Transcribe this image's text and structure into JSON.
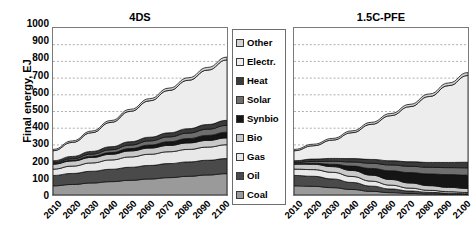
{
  "chart_data": {
    "type": "area",
    "title": "",
    "ylabel": "Final energy, EJ",
    "xlabel": "",
    "ylim": [
      0,
      1000
    ],
    "ytick_step": 100,
    "yticks": [
      1000,
      900,
      800,
      700,
      600,
      500,
      400,
      300,
      200,
      100,
      0
    ],
    "grid": true,
    "grid_style": "dotted-horizontal",
    "legend_position": "center-between-panels",
    "stack_order_bottom_to_top": [
      "Coal",
      "Oil",
      "Gas",
      "Bio",
      "Synbio",
      "Solar",
      "Heat",
      "Electr.",
      "Other"
    ],
    "series_colors": {
      "Other": "#d4d4d4",
      "Electr.": "#ededed",
      "Heat": "#3a3a3a",
      "Solar": "#6e6e6e",
      "Synbio": "#151515",
      "Bio": "#c9c9c9",
      "Gas": "#e8e8e8",
      "Oil": "#4a4a4a",
      "Coal": "#9a9a9a"
    },
    "x": [
      2010,
      2020,
      2030,
      2040,
      2050,
      2060,
      2070,
      2080,
      2090,
      2100
    ],
    "panels": [
      {
        "name": "4DS",
        "title": "4DS",
        "series": [
          {
            "name": "Coal",
            "values": [
              55,
              63,
              72,
              80,
              88,
              96,
              104,
              112,
              120,
              128
            ]
          },
          {
            "name": "Oil",
            "values": [
              62,
              66,
              70,
              74,
              78,
              81,
              84,
              86,
              88,
              90
            ]
          },
          {
            "name": "Gas",
            "values": [
              38,
              44,
              50,
              56,
              62,
              67,
              71,
              75,
              79,
              83
            ]
          },
          {
            "name": "Bio",
            "values": [
              30,
              31,
              33,
              34,
              36,
              37,
              38,
              39,
              40,
              41
            ]
          },
          {
            "name": "Synbio",
            "values": [
              2,
              4,
              7,
              10,
              14,
              18,
              22,
              26,
              30,
              34
            ]
          },
          {
            "name": "Solar",
            "values": [
              6,
              9,
              13,
              17,
              21,
              25,
              29,
              33,
              37,
              41
            ]
          },
          {
            "name": "Heat",
            "values": [
              12,
              14,
              16,
              18,
              20,
              22,
              24,
              26,
              28,
              30
            ]
          },
          {
            "name": "Electr.",
            "values": [
              60,
              84,
              112,
              146,
              182,
              218,
              254,
              290,
              326,
              362
            ]
          },
          {
            "name": "Other",
            "values": [
              8,
              9,
              10,
              11,
              12,
              13,
              14,
              15,
              16,
              17
            ]
          }
        ],
        "total_2010": 273,
        "total_2100": 826
      },
      {
        "name": "1.5C-PFE",
        "title": "1.5C-PFE",
        "series": [
          {
            "name": "Coal",
            "values": [
              55,
              52,
              44,
              33,
              22,
              14,
              9,
              6,
              4,
              3
            ]
          },
          {
            "name": "Oil",
            "values": [
              62,
              60,
              52,
              42,
              31,
              22,
              15,
              10,
              7,
              5
            ]
          },
          {
            "name": "Gas",
            "values": [
              38,
              40,
              40,
              36,
              30,
              23,
              17,
              12,
              9,
              7
            ]
          },
          {
            "name": "Bio",
            "values": [
              30,
              32,
              34,
              36,
              36,
              34,
              31,
              28,
              26,
              24
            ]
          },
          {
            "name": "Synbio",
            "values": [
              2,
              6,
              14,
              26,
              40,
              52,
              62,
              70,
              76,
              80
            ]
          },
          {
            "name": "Solar",
            "values": [
              6,
              11,
              18,
              25,
              31,
              35,
              38,
              40,
              42,
              44
            ]
          },
          {
            "name": "Heat",
            "values": [
              12,
              14,
              17,
              20,
              23,
              25,
              27,
              29,
              31,
              33
            ]
          },
          {
            "name": "Electr.",
            "values": [
              60,
              80,
              110,
              155,
              210,
              270,
              330,
              395,
              460,
              520
            ]
          },
          {
            "name": "Other",
            "values": [
              8,
              9,
              10,
              11,
              12,
              13,
              14,
              15,
              16,
              17
            ]
          }
        ],
        "total_2010": 273,
        "total_2100": 733
      }
    ]
  },
  "yaxis": {
    "title": "Final energy, EJ",
    "ticks": [
      "1000",
      "900",
      "800",
      "700",
      "600",
      "500",
      "400",
      "300",
      "200",
      "100",
      "0"
    ]
  },
  "xaxis": {
    "ticks": [
      "2010",
      "2020",
      "2030",
      "2040",
      "2050",
      "2060",
      "2070",
      "2080",
      "2090",
      "2100"
    ]
  },
  "panel_titles": {
    "left": "4DS",
    "right": "1.5C-PFE"
  },
  "legend": {
    "items": [
      {
        "label": "Other",
        "color": "#d4d4d4"
      },
      {
        "label": "Electr.",
        "color": "#ededed"
      },
      {
        "label": "Heat",
        "color": "#3a3a3a"
      },
      {
        "label": "Solar",
        "color": "#6e6e6e"
      },
      {
        "label": "Synbio",
        "color": "#151515"
      },
      {
        "label": "Bio",
        "color": "#c9c9c9"
      },
      {
        "label": "Gas",
        "color": "#e8e8e8"
      },
      {
        "label": "Oil",
        "color": "#4a4a4a"
      },
      {
        "label": "Coal",
        "color": "#9a9a9a"
      }
    ]
  }
}
